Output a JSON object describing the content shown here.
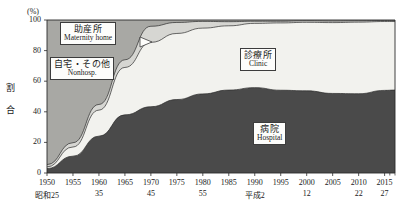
{
  "axes": {
    "y_unit": "(%)",
    "y_title_chars": [
      "割",
      "合"
    ],
    "y_ticks": [
      "0",
      "20",
      "40",
      "60",
      "80",
      "100"
    ],
    "y_values": [
      0,
      20,
      40,
      60,
      80,
      100
    ],
    "x_ticks_top": [
      "1950",
      "1955",
      "1960",
      "1965",
      "1970",
      "1975",
      "1980",
      "1985",
      "1990",
      "1995",
      "2000",
      "2005",
      "2010",
      "2015"
    ],
    "x_ticks_bottom": [
      "昭和25",
      "",
      "35",
      "",
      "45",
      "",
      "55",
      "",
      "平成2",
      "",
      "12",
      "",
      "22",
      "27"
    ]
  },
  "legend": {
    "maternity": {
      "jp": "助産所",
      "en": "Maternity home"
    },
    "nonhosp": {
      "jp": "自宅・その他",
      "en": "Nonhosp."
    },
    "clinic": {
      "jp": "診療所",
      "en": "Clinic"
    },
    "hospital": {
      "jp": "病院",
      "en": "Hospital"
    }
  },
  "colors": {
    "hospital": "#4a4a4a",
    "clinic": "#f2f2ee",
    "maternity": "#d6d6d2",
    "nonhosp": "#a8a8a4",
    "frame": "#2b2b2b",
    "callout_bg": "#fdfdfb",
    "callout_border": "#3c3c3c"
  },
  "chart_data": {
    "type": "area",
    "title": "",
    "subtitle": "",
    "xlabel": "",
    "ylabel": "割合 (%)",
    "ylim": [
      0,
      100
    ],
    "xlim": [
      1950,
      2017
    ],
    "grid": false,
    "legend_position": "inline-annotations",
    "stacked": true,
    "stack_order_bottom_to_top": [
      "hospital",
      "clinic",
      "maternity",
      "nonhosp"
    ],
    "x": [
      1950,
      1955,
      1960,
      1965,
      1970,
      1975,
      1980,
      1985,
      1990,
      1995,
      2000,
      2005,
      2010,
      2015,
      2017
    ],
    "series": [
      {
        "name": "病院 Hospital",
        "key": "hospital",
        "color": "#4a4a4a",
        "values": [
          2.9,
          11.0,
          24.1,
          38.0,
          43.3,
          48.0,
          51.7,
          54.2,
          55.8,
          54.1,
          53.7,
          52.0,
          51.8,
          54.0,
          54.2
        ]
      },
      {
        "name": "診療所 Clinic",
        "key": "clinic",
        "color": "#f2f2ee",
        "values": [
          1.1,
          6.0,
          17.0,
          31.0,
          42.1,
          43.2,
          43.0,
          42.0,
          42.0,
          44.0,
          44.8,
          46.3,
          46.8,
          45.0,
          44.8
        ]
      },
      {
        "name": "助産所 Maternity home",
        "key": "maternity",
        "color": "#d6d6d2",
        "values": [
          1.5,
          2.8,
          3.7,
          5.0,
          10.5,
          7.2,
          4.4,
          2.7,
          1.4,
          1.1,
          1.0,
          1.0,
          0.9,
          0.7,
          0.7
        ]
      },
      {
        "name": "自宅・その他 Nonhosp.",
        "key": "nonhosp",
        "color": "#a8a8a4",
        "values": [
          94.5,
          80.2,
          55.2,
          26.0,
          4.1,
          1.6,
          0.9,
          1.1,
          0.8,
          0.8,
          0.5,
          0.7,
          0.5,
          0.3,
          0.3
        ]
      }
    ],
    "boundaries_cumulative_from_bottom": {
      "hospital_top": [
        2.9,
        11.0,
        24.1,
        38.0,
        43.3,
        48.0,
        51.7,
        54.2,
        55.8,
        54.1,
        53.7,
        52.0,
        51.8,
        54.0,
        54.2
      ],
      "clinic_top": [
        4.0,
        17.0,
        41.1,
        69.0,
        85.4,
        91.2,
        94.7,
        96.2,
        97.8,
        98.1,
        98.5,
        98.3,
        98.6,
        99.0,
        99.0
      ],
      "maternity_top": [
        5.5,
        19.8,
        44.8,
        74.0,
        95.9,
        98.4,
        99.1,
        98.9,
        99.2,
        99.2,
        99.5,
        99.3,
        99.5,
        99.7,
        99.7
      ],
      "nonhosp_top": [
        100,
        100,
        100,
        100,
        100,
        100,
        100,
        100,
        100,
        100,
        100,
        100,
        100,
        100,
        100
      ]
    }
  }
}
